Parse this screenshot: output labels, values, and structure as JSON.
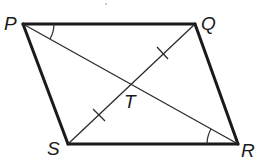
{
  "figure": {
    "type": "parallelogram",
    "vertices": [
      {
        "label": "P",
        "x": 23,
        "y": 24
      },
      {
        "label": "Q",
        "x": 195,
        "y": 24
      },
      {
        "label": "R",
        "x": 238,
        "y": 144
      },
      {
        "label": "S",
        "x": 68,
        "y": 144
      }
    ],
    "intersection": {
      "label": "T",
      "x": 131,
      "y": 84
    },
    "sides": [
      "PQ",
      "QR",
      "RS",
      "SP"
    ],
    "diagonals": [
      "PR",
      "QS"
    ],
    "congruence_marks": {
      "segments": [
        "QT",
        "ST"
      ],
      "ticks": 1
    },
    "angle_marks": [
      {
        "vertex": "P",
        "between": [
          "PQ",
          "PR"
        ]
      },
      {
        "vertex": "R",
        "between": [
          "RS",
          "RP"
        ]
      }
    ]
  },
  "labels": {
    "P": "P",
    "Q": "Q",
    "R": "R",
    "S": "S",
    "T": "T"
  }
}
